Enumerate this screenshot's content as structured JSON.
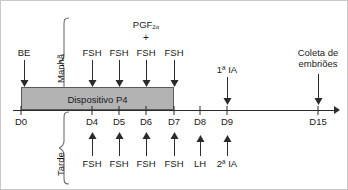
{
  "diagram": {
    "title_text": "Protocolo de superovulação e transferência de embriões",
    "axis": {
      "ticks": [
        {
          "id": "D0",
          "label": "D0",
          "x": 20
        },
        {
          "id": "D4",
          "label": "D4",
          "x": 91
        },
        {
          "id": "D5",
          "label": "D5",
          "x": 118
        },
        {
          "id": "D6",
          "label": "D6",
          "x": 145
        },
        {
          "id": "D7",
          "label": "D7",
          "x": 173
        },
        {
          "id": "D8",
          "label": "D8",
          "x": 199
        },
        {
          "id": "D9",
          "label": "D9",
          "x": 226
        },
        {
          "id": "D15",
          "label": "D15",
          "x": 317
        }
      ]
    },
    "period_labels": {
      "morning": "Manhã",
      "afternoon": "Tarde"
    },
    "device_bar": {
      "label": "Dispositivo P4",
      "start_day": "D0",
      "end_day": "D7"
    },
    "morning_events": [
      {
        "id": "be",
        "label": "BE",
        "x": 23
      },
      {
        "id": "fsh1",
        "label": "FSH",
        "x": 91
      },
      {
        "id": "fsh2",
        "label": "FSH",
        "x": 118
      },
      {
        "id": "fsh3",
        "label": "FSH",
        "x": 145
      },
      {
        "id": "fsh4",
        "label": "FSH",
        "x": 173
      },
      {
        "id": "ia1",
        "label": "1ª IA",
        "x": 226
      },
      {
        "id": "coleta",
        "label": "Coleta de",
        "label2": "embriões",
        "x": 317
      }
    ],
    "afternoon_events": [
      {
        "id": "fsh5",
        "label": "FSH",
        "x": 91
      },
      {
        "id": "fsh6",
        "label": "FSH",
        "x": 118
      },
      {
        "id": "fsh7",
        "label": "FSH",
        "x": 145
      },
      {
        "id": "fsh8",
        "label": "FSH",
        "x": 173
      },
      {
        "id": "lh",
        "label": "LH",
        "x": 199
      },
      {
        "id": "ia2",
        "label": "2ª IA",
        "x": 226
      }
    ],
    "pgf_annotation": {
      "base": "PGF",
      "subscript": "2α",
      "plus": "+",
      "x": 145
    },
    "colors": {
      "line": "#2b2b2b",
      "device_bar_fill": "#b3b3b3",
      "device_bar_stroke": "#5a5a5a",
      "brace": "#6e6e6e",
      "text": "#1a1a1a",
      "background": "#ffffff"
    }
  }
}
